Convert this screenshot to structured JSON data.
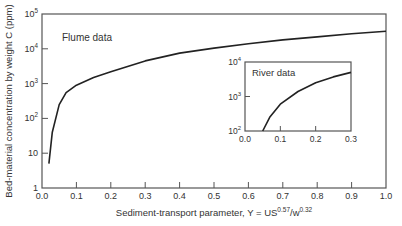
{
  "chart_data": [
    {
      "type": "line",
      "title": "",
      "annotation": "Flume data",
      "xlabel": "Sediment-transport parameter, Y = US^0.57/w^0.32",
      "xlabel_parts": {
        "base": "Sediment-transport parameter, Y = US",
        "exp1": "0.57",
        "mid": "/w",
        "exp2": "0.32"
      },
      "ylabel": "Bed-material concentration by weight C (ppm)",
      "xlim": [
        0.0,
        1.0
      ],
      "ylim": [
        1,
        100000
      ],
      "yscale": "log",
      "x_ticks": [
        "0.0",
        "0.1",
        "0.2",
        "0.3",
        "0.4",
        "0.5",
        "0.6",
        "0.7",
        "0.8",
        "0.9",
        "1.0"
      ],
      "y_ticks": [
        {
          "value": 1,
          "base": "1",
          "exp": ""
        },
        {
          "value": 10,
          "base": "10",
          "exp": ""
        },
        {
          "value": 100,
          "base": "10",
          "exp": "2"
        },
        {
          "value": 1000,
          "base": "10",
          "exp": "3"
        },
        {
          "value": 10000,
          "base": "10",
          "exp": "4"
        },
        {
          "value": 100000,
          "base": "10",
          "exp": "5"
        }
      ],
      "grid": false,
      "series": [
        {
          "name": "Flume data",
          "x": [
            0.02,
            0.03,
            0.05,
            0.07,
            0.1,
            0.15,
            0.2,
            0.3,
            0.4,
            0.5,
            0.6,
            0.7,
            0.8,
            0.9,
            1.0
          ],
          "y": [
            5,
            40,
            250,
            550,
            900,
            1500,
            2200,
            4500,
            7500,
            10500,
            14000,
            18000,
            22000,
            27000,
            32000
          ]
        }
      ]
    },
    {
      "type": "line",
      "title": "",
      "annotation": "River data",
      "xlim": [
        0.0,
        0.3
      ],
      "ylim": [
        100,
        10000
      ],
      "yscale": "log",
      "x_ticks": [
        "0.0",
        "0.1",
        "0.2",
        "0.3"
      ],
      "y_ticks": [
        {
          "value": 100,
          "base": "10",
          "exp": "2"
        },
        {
          "value": 1000,
          "base": "10",
          "exp": "3"
        },
        {
          "value": 10000,
          "base": "10",
          "exp": "4"
        }
      ],
      "grid": false,
      "series": [
        {
          "name": "River data",
          "x": [
            0.05,
            0.07,
            0.1,
            0.15,
            0.2,
            0.25,
            0.3
          ],
          "y": [
            100,
            250,
            600,
            1400,
            2500,
            3700,
            5000
          ]
        }
      ]
    }
  ]
}
